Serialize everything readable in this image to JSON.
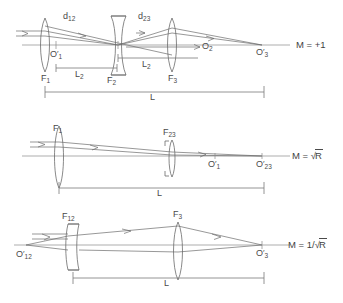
{
  "figure": {
    "type": "optical-ray-diagram",
    "background_color": "#ffffff",
    "ink_color": "#4a4a4a",
    "panels": [
      {
        "id": "panel-1",
        "magnification_label": "M = +1",
        "magnification_value": "+1",
        "lenses": [
          {
            "label": "F",
            "subscript": "1",
            "shape": "biconvex"
          },
          {
            "label": "F",
            "subscript": "2",
            "shape": "biconcave"
          },
          {
            "label": "F",
            "subscript": "3",
            "shape": "biconvex"
          }
        ],
        "points": [
          {
            "label": "O",
            "prime": true,
            "subscript": "1"
          },
          {
            "label": "O",
            "prime": false,
            "subscript": "2"
          },
          {
            "label": "O",
            "prime": true,
            "subscript": "3"
          }
        ],
        "spacings": [
          {
            "label": "d",
            "subscript": "12"
          },
          {
            "label": "d",
            "subscript": "23"
          }
        ],
        "brackets": [
          {
            "label": "L",
            "subscript": "2"
          },
          {
            "label": "L",
            "subscript": "2"
          },
          {
            "label": "L",
            "subscript": ""
          }
        ]
      },
      {
        "id": "panel-2",
        "magnification_label": "M = √R",
        "magnification_prefix": "M = ",
        "magnification_radicand": "R",
        "lenses": [
          {
            "label": "F",
            "subscript": "1",
            "shape": "biconvex"
          },
          {
            "label": "F",
            "subscript": "23",
            "shape": "biconvex-thin"
          }
        ],
        "points": [
          {
            "label": "O",
            "prime": true,
            "subscript": "1"
          },
          {
            "label": "O",
            "prime": true,
            "subscript": "23"
          }
        ],
        "brackets": [
          {
            "label": "L",
            "subscript": ""
          }
        ]
      },
      {
        "id": "panel-3",
        "magnification_label": "M = 1/√R",
        "magnification_prefix": "M = 1/",
        "magnification_radicand": "R",
        "lenses": [
          {
            "label": "F",
            "subscript": "12",
            "shape": "thick-meniscus"
          },
          {
            "label": "F",
            "subscript": "3",
            "shape": "biconvex"
          }
        ],
        "points": [
          {
            "label": "O",
            "prime": true,
            "subscript": "12"
          },
          {
            "label": "O",
            "prime": true,
            "subscript": "3"
          }
        ],
        "brackets": [
          {
            "label": "L",
            "subscript": ""
          }
        ]
      }
    ]
  },
  "labels": {
    "p1_d12": "d",
    "p1_d12_sub": "12",
    "p1_d23": "d",
    "p1_d23_sub": "23",
    "p1_O1": "O",
    "p1_O1_sub": "1",
    "p1_O2": "O",
    "p1_O2_sub": "2",
    "p1_O3": "O",
    "p1_O3_sub": "3",
    "p1_F1": "F",
    "p1_F1_sub": "1",
    "p1_F2": "F",
    "p1_F2_sub": "2",
    "p1_F3": "F",
    "p1_F3_sub": "3",
    "p1_L2a": "L",
    "p1_L2a_sub": "2",
    "p1_L2b": "L",
    "p1_L2b_sub": "2",
    "p1_L": "L",
    "p1_M": "M = +1",
    "p2_F1": "F",
    "p2_F1_sub": "1",
    "p2_F23": "F",
    "p2_F23_sub": "23",
    "p2_O1": "O",
    "p2_O1_sub": "1",
    "p2_O23": "O",
    "p2_O23_sub": "23",
    "p2_L": "L",
    "p2_M_prefix": "M = ",
    "p2_M_radicand": "R",
    "p3_F12": "F",
    "p3_F12_sub": "12",
    "p3_F3": "F",
    "p3_F3_sub": "3",
    "p3_O12": "O",
    "p3_O12_sub": "12",
    "p3_O3": "O",
    "p3_O3_sub": "3",
    "p3_L": "L",
    "p3_M_prefix": "M = 1/",
    "p3_M_radicand": "R"
  }
}
